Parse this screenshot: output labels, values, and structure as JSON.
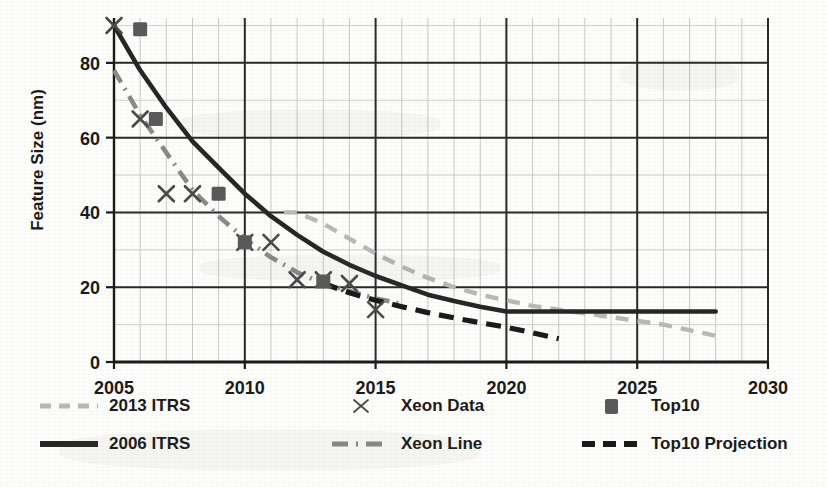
{
  "chart_data": {
    "type": "line",
    "title": "",
    "xlabel": "",
    "ylabel": "Feature Size (nm)",
    "xlim": [
      2005,
      2030
    ],
    "ylim": [
      0,
      92
    ],
    "xticks": [
      2005,
      2010,
      2015,
      2020,
      2025,
      2030
    ],
    "yticks": [
      0,
      20,
      40,
      60,
      80
    ],
    "xtick_labels": [
      "2005",
      "2010",
      "2015",
      "2020",
      "2025",
      "2030"
    ],
    "ytick_labels": [
      "0",
      "20",
      "40",
      "60",
      "80"
    ],
    "x_minor_step": 1,
    "y_minor_step": 10,
    "grid": true,
    "legend_position": "below",
    "series": [
      {
        "name": "2013 ITRS",
        "style": "dashed",
        "color": "#b8b8b8",
        "x": [
          2011.5,
          2012,
          2013,
          2014,
          2015,
          2016,
          2017,
          2018,
          2019,
          2020,
          2021,
          2022,
          2023,
          2024,
          2025,
          2026,
          2027,
          2028
        ],
        "y": [
          40,
          40,
          37,
          33,
          29,
          25.5,
          22.5,
          20,
          18,
          16.5,
          15,
          14,
          13,
          12,
          11,
          10,
          8.5,
          7
        ]
      },
      {
        "name": "2006 ITRS",
        "style": "solid",
        "color": "#262626",
        "x": [
          2005,
          2006,
          2007,
          2008,
          2009,
          2010,
          2011,
          2012,
          2013,
          2014,
          2015,
          2016,
          2017,
          2018,
          2019,
          2020,
          2022,
          2024,
          2026,
          2028
        ],
        "y": [
          90,
          78,
          68,
          59,
          52,
          45,
          39,
          34,
          29.5,
          26,
          23,
          20.5,
          18,
          16.3,
          14.8,
          13.5,
          13.5,
          13.5,
          13.5,
          13.5
        ]
      },
      {
        "name": "Xeon Line",
        "style": "dash-dot",
        "color": "#8a8a8a",
        "x": [
          2005,
          2006,
          2007,
          2008,
          2009,
          2010,
          2011,
          2012,
          2013,
          2014,
          2015,
          2016
        ],
        "y": [
          78,
          66,
          56,
          46,
          39,
          33,
          28,
          24,
          21,
          19,
          17,
          15.5
        ]
      },
      {
        "name": "Top10 Projection",
        "style": "dashed-heavy",
        "color": "#1a1a1a",
        "x": [
          2013,
          2014,
          2015,
          2016,
          2017,
          2018,
          2019,
          2020,
          2021,
          2022
        ],
        "y": [
          21,
          18.5,
          16.5,
          14.8,
          13.2,
          11.8,
          10.5,
          9.3,
          7.8,
          6.2
        ]
      }
    ],
    "scatter": [
      {
        "name": "Xeon Data",
        "marker": "x",
        "color": "#4a4a4a",
        "points": [
          {
            "x": 2005,
            "y": 90
          },
          {
            "x": 2006,
            "y": 65
          },
          {
            "x": 2007,
            "y": 45
          },
          {
            "x": 2008,
            "y": 45
          },
          {
            "x": 2010,
            "y": 32
          },
          {
            "x": 2011,
            "y": 32
          },
          {
            "x": 2012,
            "y": 22
          },
          {
            "x": 2013,
            "y": 22
          },
          {
            "x": 2014,
            "y": 21
          },
          {
            "x": 2015,
            "y": 14
          }
        ]
      },
      {
        "name": "Top10",
        "marker": "square",
        "color": "#595959",
        "points": [
          {
            "x": 2006,
            "y": 89
          },
          {
            "x": 2006.6,
            "y": 65
          },
          {
            "x": 2009,
            "y": 45
          },
          {
            "x": 2010,
            "y": 32
          },
          {
            "x": 2013,
            "y": 21.5
          }
        ]
      }
    ]
  },
  "legend": {
    "entries": [
      {
        "id": "itrs2013",
        "label": "2013 ITRS",
        "swatch": "dashed-light-line"
      },
      {
        "id": "xeon-data",
        "label": "Xeon Data",
        "swatch": "x-marker"
      },
      {
        "id": "top10",
        "label": "Top10",
        "swatch": "square-marker"
      },
      {
        "id": "itrs2006",
        "label": "2006 ITRS",
        "swatch": "solid-black-line"
      },
      {
        "id": "xeon-line",
        "label": "Xeon Line",
        "swatch": "dash-dot-line"
      },
      {
        "id": "top10-projection",
        "label": "Top10  Projection",
        "swatch": "dashed-black-line"
      }
    ]
  },
  "colors": {
    "axis": "#1a1a1a",
    "major_grid": "#2a2a2a",
    "minor_grid": "#c9c9c9",
    "itrs2013": "#b8b8b8",
    "itrs2006": "#262626",
    "xeon_line": "#8a8a8a",
    "top10_projection": "#1a1a1a",
    "xeon_marker": "#4a4a4a",
    "top10_marker": "#595959",
    "paper": "#fdfdfb"
  }
}
